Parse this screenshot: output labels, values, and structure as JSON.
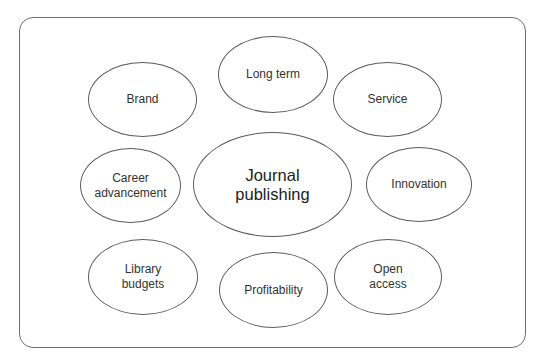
{
  "diagram": {
    "center": {
      "label": "Journal\npublishing"
    },
    "nodes": [
      {
        "id": "long-term",
        "label": "Long term"
      },
      {
        "id": "brand",
        "label": "Brand"
      },
      {
        "id": "service",
        "label": "Service"
      },
      {
        "id": "career-advancement",
        "label": "Career\nadvancement"
      },
      {
        "id": "innovation",
        "label": "Innovation"
      },
      {
        "id": "library-budgets",
        "label": "Library\nbudgets"
      },
      {
        "id": "profitability",
        "label": "Profitability"
      },
      {
        "id": "open-access",
        "label": "Open\naccess"
      }
    ]
  }
}
